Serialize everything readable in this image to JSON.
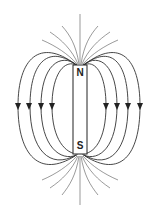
{
  "diagram": {
    "magnet": {
      "north_label": "N",
      "south_label": "S"
    },
    "arrows": {
      "direction": "down",
      "count_left": 4,
      "count_right": 4
    },
    "colors": {
      "line": "#333333",
      "background": "#ffffff"
    }
  }
}
